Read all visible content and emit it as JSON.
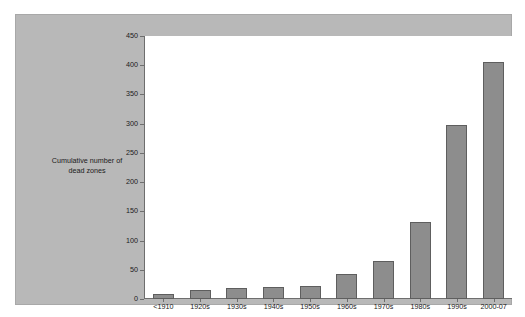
{
  "chart_data": {
    "type": "bar",
    "title": "",
    "xlabel": "",
    "ylabel": "Cumulative number of dead zones",
    "ylabel_lines": [
      "Cumulative number of",
      "dead zones"
    ],
    "categories": [
      "<1910",
      "1920s",
      "1930s",
      "1940s",
      "1950s",
      "1960s",
      "1970s",
      "1980s",
      "1990s",
      "2000-07"
    ],
    "values": [
      9,
      15,
      18,
      21,
      22,
      42,
      65,
      132,
      297,
      405
    ],
    "ylim": [
      0,
      450
    ],
    "yticks": [
      0,
      50,
      100,
      150,
      200,
      250,
      300,
      350,
      400,
      450
    ],
    "ytick_labels": [
      "0",
      "50",
      "100",
      "150",
      "200",
      "250",
      "300",
      "350",
      "400",
      "450"
    ],
    "grid": false,
    "legend": null,
    "colors": {
      "bar_fill": "#8d8d8d",
      "bar_edge": "#5e5e5e",
      "panel_background": "#b8b8b8",
      "plot_background": "#ffffff",
      "axis": "#6e6e6e",
      "text": "#1a1a1a"
    }
  }
}
